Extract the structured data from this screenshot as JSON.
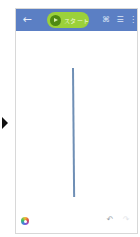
{
  "side_panel": {
    "expand_icon": "triangle-right"
  },
  "header": {
    "back_icon": "←",
    "start_button": {
      "label": "スタート",
      "icon": "play-icon"
    },
    "icons": [
      {
        "name": "gallery-icon",
        "glyph": "⌘"
      },
      {
        "name": "menu-list-icon",
        "glyph": "☰"
      },
      {
        "name": "more-vert-icon",
        "glyph": "⋮"
      }
    ]
  },
  "canvas": {
    "stroke": {
      "color": "#6f8fb5",
      "from": [
        72,
        67
      ],
      "to": [
        74,
        196
      ]
    }
  },
  "bottom_bar": {
    "color_picker_icon": "color-wheel",
    "undo_icon": "↶",
    "redo_icon": "↷"
  },
  "colors": {
    "header_bg": "#5b7fc4",
    "start_button_bg": "#9bd13a",
    "stroke": "#6f8fb5"
  }
}
